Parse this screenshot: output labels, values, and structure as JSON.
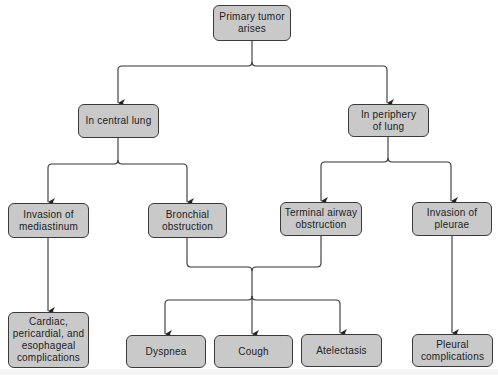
{
  "diagram": {
    "type": "flowchart",
    "colors": {
      "node_fill": "#c9c9c9",
      "node_border": "#3a3a3a",
      "line": "#333333",
      "text": "#222222",
      "background": "#ffffff"
    },
    "nodes": {
      "primary": {
        "label": "Primary tumor\narises"
      },
      "central": {
        "label": "In central lung"
      },
      "periphery": {
        "label": "In periphery\nof lung"
      },
      "mediastinum": {
        "label": "Invasion of\nmediastinum"
      },
      "bronchial": {
        "label": "Bronchial\nobstruction"
      },
      "terminal": {
        "label": "Terminal airway\nobstruction"
      },
      "pleurae": {
        "label": "Invasion of\npleurae"
      },
      "cardiac": {
        "label": "Cardiac,\npericardial, and\nesophageal\ncomplications"
      },
      "dyspnea": {
        "label": "Dyspnea"
      },
      "cough": {
        "label": "Cough"
      },
      "atelectasis": {
        "label": "Atelectasis"
      },
      "pleural_comp": {
        "label": "Pleural\ncomplications"
      }
    },
    "edges": [
      [
        "primary",
        "central"
      ],
      [
        "primary",
        "periphery"
      ],
      [
        "central",
        "mediastinum"
      ],
      [
        "central",
        "bronchial"
      ],
      [
        "periphery",
        "terminal"
      ],
      [
        "periphery",
        "pleurae"
      ],
      [
        "mediastinum",
        "cardiac"
      ],
      [
        "bronchial",
        "dyspnea"
      ],
      [
        "bronchial",
        "cough"
      ],
      [
        "bronchial",
        "atelectasis"
      ],
      [
        "terminal",
        "dyspnea"
      ],
      [
        "terminal",
        "cough"
      ],
      [
        "terminal",
        "atelectasis"
      ],
      [
        "pleurae",
        "pleural_comp"
      ]
    ]
  }
}
